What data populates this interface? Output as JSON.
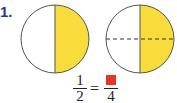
{
  "problem": {
    "number": "1."
  },
  "figures": [
    {
      "name": "circle-halves",
      "parts": 2,
      "shaded": 1,
      "shade_color": "#f7dc3b",
      "divider": "solid"
    },
    {
      "name": "circle-quarters",
      "parts": 4,
      "shaded": 2,
      "shade_color": "#f7dc3b",
      "divider": "dashed"
    }
  ],
  "equation": {
    "left": {
      "numerator": "1",
      "denominator": "2"
    },
    "operator": "=",
    "right": {
      "numerator_blank_color": "#e8352a",
      "denominator": "4"
    }
  }
}
